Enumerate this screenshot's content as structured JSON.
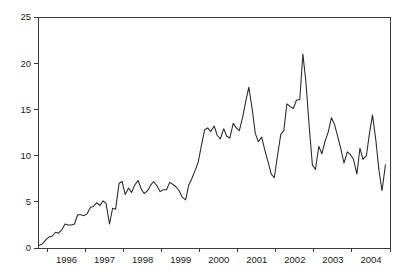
{
  "chart_data": {
    "type": "line",
    "title": "",
    "subtitle": "",
    "xlabel": "",
    "ylabel": "",
    "xlim": [
      1995.75,
      2005.0
    ],
    "ylim": [
      0,
      25
    ],
    "grid": false,
    "legend": null,
    "legend_position": "none",
    "line_color": "#262626",
    "axis_color": "#3a3a3a",
    "background_color": "#ffffff",
    "y_ticks": [
      0,
      5,
      10,
      15,
      20,
      25
    ],
    "y_tick_labels": [
      "0",
      "5",
      "10",
      "15",
      "20",
      "25"
    ],
    "x_tick_positions": [
      1996,
      1997,
      1998,
      1999,
      2000,
      2001,
      2002,
      2003,
      2004,
      2005
    ],
    "x_tick_labels": [
      "1996",
      "1997",
      "1998",
      "1999",
      "2000",
      "2001",
      "2002",
      "2003",
      "2004"
    ],
    "x_label_positions": [
      1996.5,
      1997.5,
      1998.5,
      1999.5,
      2000.5,
      2001.5,
      2002.5,
      2003.5,
      2004.5
    ],
    "series": [
      {
        "name": "series-1",
        "x": [
          1995.79,
          1995.88,
          1995.96,
          1996.04,
          1996.13,
          1996.21,
          1996.29,
          1996.38,
          1996.46,
          1996.54,
          1996.63,
          1996.71,
          1996.79,
          1996.88,
          1996.96,
          1997.04,
          1997.13,
          1997.21,
          1997.29,
          1997.38,
          1997.46,
          1997.54,
          1997.63,
          1997.71,
          1997.79,
          1997.88,
          1997.96,
          1998.04,
          1998.13,
          1998.21,
          1998.29,
          1998.38,
          1998.46,
          1998.54,
          1998.63,
          1998.71,
          1998.79,
          1998.88,
          1998.96,
          1999.04,
          1999.13,
          1999.21,
          1999.29,
          1999.38,
          1999.46,
          1999.54,
          1999.63,
          1999.71,
          1999.79,
          1999.88,
          1999.96,
          2000.04,
          2000.13,
          2000.21,
          2000.29,
          2000.38,
          2000.46,
          2000.54,
          2000.63,
          2000.71,
          2000.79,
          2000.88,
          2000.96,
          2001.04,
          2001.13,
          2001.21,
          2001.29,
          2001.38,
          2001.46,
          2001.54,
          2001.63,
          2001.71,
          2001.79,
          2001.88,
          2001.96,
          2002.04,
          2002.13,
          2002.21,
          2002.29,
          2002.38,
          2002.46,
          2002.54,
          2002.63,
          2002.71,
          2002.79,
          2002.88,
          2002.96,
          2003.04,
          2003.13,
          2003.21,
          2003.29,
          2003.38,
          2003.46,
          2003.54,
          2003.63,
          2003.71,
          2003.79,
          2003.88,
          2003.96,
          2004.04,
          2004.13,
          2004.21,
          2004.29,
          2004.38,
          2004.46,
          2004.54,
          2004.63,
          2004.71,
          2004.79,
          2004.88
        ],
        "y": [
          0.3,
          0.5,
          0.9,
          1.2,
          1.3,
          1.7,
          1.6,
          2.0,
          2.6,
          2.5,
          2.5,
          2.6,
          3.6,
          3.6,
          3.5,
          3.7,
          4.4,
          4.5,
          4.9,
          4.6,
          5.1,
          4.8,
          2.6,
          4.3,
          4.2,
          7.0,
          7.2,
          5.8,
          6.5,
          6.0,
          6.8,
          7.3,
          6.4,
          5.9,
          6.2,
          6.8,
          7.2,
          6.7,
          6.1,
          6.3,
          6.3,
          7.1,
          6.9,
          6.6,
          6.2,
          5.5,
          5.2,
          6.8,
          7.5,
          8.4,
          9.3,
          11.0,
          12.8,
          13.0,
          12.6,
          13.2,
          12.2,
          11.8,
          12.9,
          12.1,
          11.9,
          13.5,
          13.0,
          12.7,
          14.2,
          15.9,
          17.4,
          15.0,
          12.4,
          11.5,
          12.0,
          10.6,
          9.4,
          8.0,
          7.6,
          9.9,
          12.3,
          12.7,
          15.6,
          15.3,
          15.1,
          16.0,
          16.1,
          21.0,
          18.0,
          13.0,
          9.0,
          8.5,
          11.0,
          10.2,
          11.5,
          12.6,
          14.1,
          13.4,
          12.0,
          10.7,
          9.2,
          10.4,
          10.1,
          9.6,
          8.0,
          10.8,
          9.6,
          10.0,
          12.4,
          14.4,
          11.6,
          8.4,
          6.2,
          9.0
        ]
      }
    ]
  },
  "plot_geometry": {
    "left": 38,
    "right": 390,
    "top": 17,
    "bottom": 248
  }
}
